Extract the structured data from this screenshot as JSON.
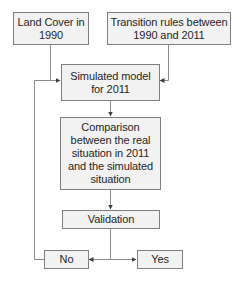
{
  "diagram": {
    "type": "flowchart",
    "nodes": {
      "land_cover": "Land Cover in\n1990",
      "transition_rules": "Transition rules between\n1990 and 2011",
      "simulated_model": "Simulated model\nfor 2011",
      "comparison": "Comparison\nbetween the real\nsituation in 2011\nand the simulated\nsituation",
      "validation": "Validation",
      "no": "No",
      "yes": "Yes"
    },
    "edges": [
      {
        "from": "land_cover",
        "to": "simulated_model"
      },
      {
        "from": "transition_rules",
        "to": "simulated_model"
      },
      {
        "from": "simulated_model",
        "to": "comparison"
      },
      {
        "from": "comparison",
        "to": "validation"
      },
      {
        "from": "validation",
        "to": "no"
      },
      {
        "from": "validation",
        "to": "yes"
      },
      {
        "from": "no",
        "to": "simulated_model"
      }
    ],
    "colors": {
      "box_fill": "#f2f2f2",
      "box_border": "#7f7f7f",
      "line": "#8c8c8c",
      "text": "#262626"
    }
  }
}
